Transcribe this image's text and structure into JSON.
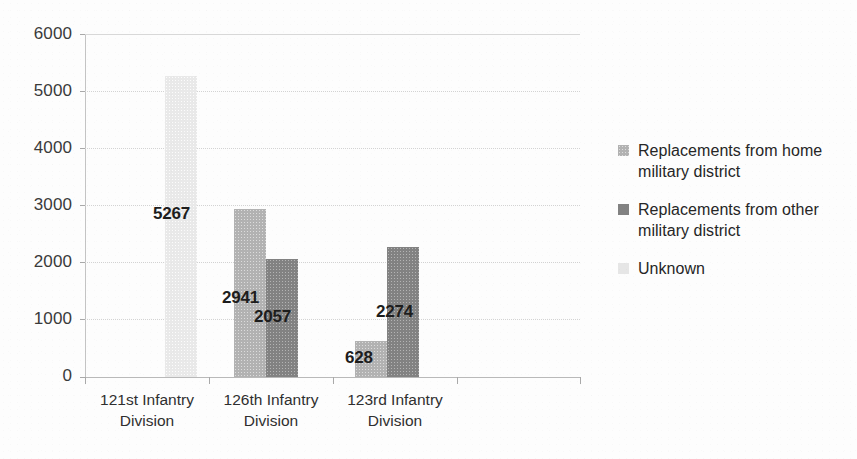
{
  "chart_data": {
    "type": "bar",
    "title": "",
    "subtitle": "",
    "xlabel": "",
    "ylabel": "",
    "ylim": [
      0,
      6000
    ],
    "ytick_labels": [
      "6000",
      "5000",
      "4000",
      "3000",
      "2000",
      "1000",
      "0"
    ],
    "ytick_values": [
      6000,
      5000,
      4000,
      3000,
      2000,
      1000,
      0
    ],
    "grid": "horizontal-dotted",
    "legend_position": "right",
    "categories": [
      "121st Infantry Division",
      "126th Infantry Division",
      "123rd Infantry Division"
    ],
    "category_lines": [
      [
        "121st Infantry",
        "Division"
      ],
      [
        "126th Infantry",
        "Division"
      ],
      [
        "123rd Infantry",
        "Division"
      ]
    ],
    "series": [
      {
        "name": "Replacements from home military district",
        "name_lines": [
          "Replacements from home",
          "military district"
        ],
        "color": "#b2b2b2",
        "values": [
          null,
          2941,
          628
        ],
        "labels": [
          "",
          "2941",
          "628"
        ]
      },
      {
        "name": "Replacements from other military district",
        "name_lines": [
          "Replacements from other",
          "military district"
        ],
        "color": "#828282",
        "values": [
          null,
          2057,
          2274
        ],
        "labels": [
          "",
          "2057",
          "2274"
        ]
      },
      {
        "name": "Unknown",
        "name_lines": [
          "Unknown"
        ],
        "color": "#e6e6e6",
        "values": [
          5267,
          null,
          null
        ],
        "labels": [
          "5267",
          "",
          ""
        ]
      }
    ],
    "data_labels": [
      "5267",
      "2941",
      "2057",
      "628",
      "2274"
    ]
  },
  "colors": {
    "background": "#fdfdfd",
    "gridline": "#d3d3d3",
    "axis": "#b9b9b9",
    "text": "#2f2f2f",
    "series_home": "#b2b2b2",
    "series_other": "#828282",
    "series_unknown": "#e6e6e6"
  }
}
